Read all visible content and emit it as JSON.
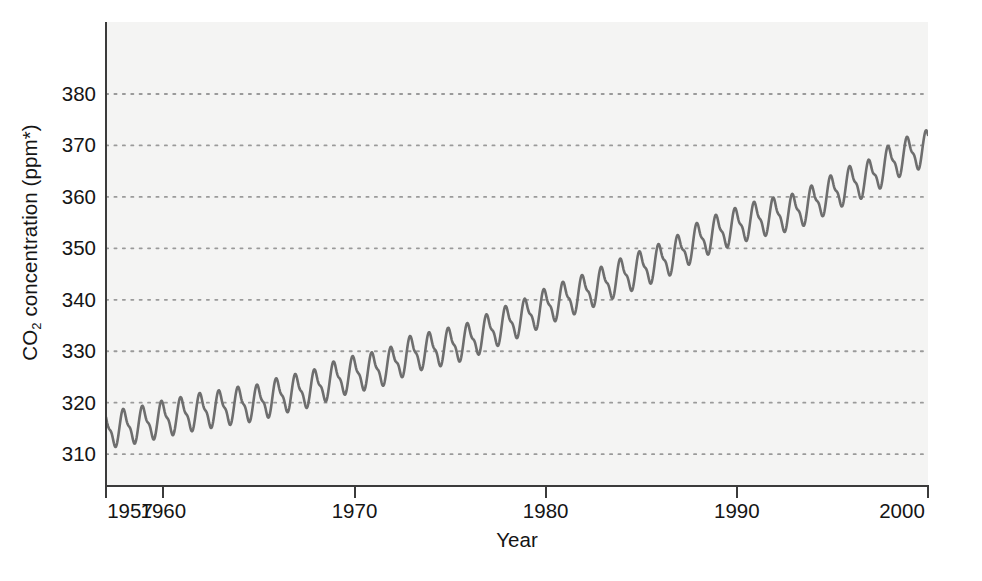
{
  "chart_data": {
    "type": "line",
    "title": "",
    "subtitle": "",
    "xlabel": "Year",
    "ylabel": "CO2 concentration (ppm*)",
    "ylabel_parts": {
      "prefix": "CO",
      "sub": "2",
      "suffix": " concentration (ppm*)"
    },
    "xlim": [
      1957,
      2000
    ],
    "ylim": [
      304,
      394
    ],
    "grid": true,
    "grid_axis": "y",
    "grid_style": "dotted",
    "legend": "none",
    "annotations": [],
    "series_name": "Atmospheric CO2 (Mauna Loa monthly mean)",
    "line_color": "#6e6e6e",
    "line_width": 2.6,
    "panel_background": "#f4f4f3",
    "grid_color": "#9a9a9a",
    "axis_color": "#3b3b3b",
    "text_color": "#151515",
    "seasonal_amplitude_ppm": 3.1,
    "seasonal_period_years": 1,
    "yticks": [
      310,
      320,
      330,
      340,
      350,
      360,
      370,
      380
    ],
    "ytick_labels": [
      "310",
      "320",
      "330",
      "340",
      "350",
      "360",
      "370",
      "380"
    ],
    "xticks": [
      1957,
      1960,
      1970,
      1980,
      1990,
      2000
    ],
    "xtick_labels": [
      "1957",
      "1960",
      "1970",
      "1980",
      "1990",
      "2000"
    ],
    "x": [
      1957,
      1958,
      1959,
      1960,
      1961,
      1962,
      1963,
      1964,
      1965,
      1966,
      1967,
      1968,
      1969,
      1970,
      1971,
      1972,
      1973,
      1974,
      1975,
      1976,
      1977,
      1978,
      1979,
      1980,
      1981,
      1982,
      1983,
      1984,
      1985,
      1986,
      1987,
      1988,
      1989,
      1990,
      1991,
      1992,
      1993,
      1994,
      1995,
      1996,
      1997,
      1998,
      1999,
      2000
    ],
    "values": [
      314.6,
      315.3,
      315.9,
      316.9,
      317.6,
      318.4,
      318.9,
      319.6,
      320.0,
      321.3,
      322.1,
      323.0,
      324.6,
      325.6,
      326.3,
      327.4,
      329.6,
      330.2,
      331.1,
      332.0,
      333.8,
      335.4,
      336.8,
      338.7,
      340.1,
      341.4,
      343.0,
      344.6,
      346.0,
      347.4,
      349.2,
      351.6,
      353.1,
      354.4,
      355.6,
      356.4,
      357.1,
      358.8,
      360.8,
      362.6,
      363.8,
      366.6,
      368.3,
      369.5
    ]
  },
  "axis": {
    "y_title": "CO2 concentration (ppm*)",
    "x_title": "Year"
  }
}
